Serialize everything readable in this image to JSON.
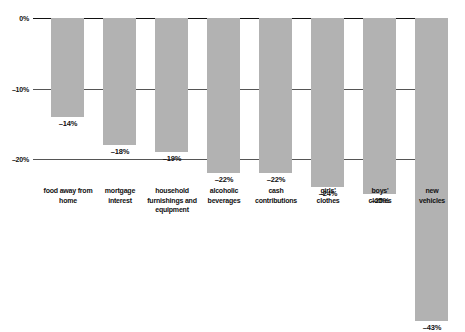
{
  "chart_data": {
    "type": "bar",
    "title": "",
    "subtitle": "",
    "xlabel": "",
    "ylabel": "",
    "orientation": "vertical",
    "grid": true,
    "legend": "none",
    "ylim": [
      -45,
      0
    ],
    "yticks": [
      0,
      -10,
      -20
    ],
    "ytick_labels": [
      "0%",
      "–10%",
      "–20%"
    ],
    "categories": [
      "food away from home",
      "mortgage interest",
      "household furnishings and equipment",
      "alcoholic beverages",
      "cash contributions",
      "girls' clothes",
      "boys' clothes",
      "new vehicles"
    ],
    "category_lines": [
      [
        "food away from",
        "home"
      ],
      [
        "mortgage",
        "interest"
      ],
      [
        "household",
        "furnishings and",
        "equipment"
      ],
      [
        "alcoholic",
        "beverages"
      ],
      [
        "cash",
        "contributions"
      ],
      [
        "girls'",
        "clothes"
      ],
      [
        "boys'",
        "clothes"
      ],
      [
        "new",
        "vehicles"
      ]
    ],
    "values": [
      -14,
      -18,
      -19,
      -22,
      -22,
      -24,
      -25,
      -43
    ],
    "value_labels": [
      "–14%",
      "–18%",
      "–19%",
      "–22%",
      "–22%",
      "–24%",
      "–25%",
      "–43%"
    ],
    "bar_color": "#b2b2b2",
    "axis_color": "#111111"
  }
}
